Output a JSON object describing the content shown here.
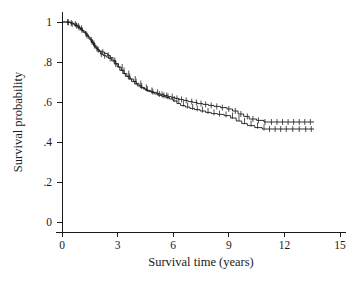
{
  "chart_data": {
    "type": "line",
    "title": "",
    "subtitle": "",
    "xlabel": "Survival time (years)",
    "ylabel": "Survival probability",
    "xlim": [
      0,
      15
    ],
    "ylim": [
      0,
      1
    ],
    "xticks": [
      0,
      3,
      6,
      9,
      12,
      15
    ],
    "xtick_labels": [
      "0",
      "3",
      "6",
      "9",
      "12",
      "15"
    ],
    "yticks": [
      0,
      0.2,
      0.4,
      0.6,
      0.8,
      1
    ],
    "ytick_labels": [
      "0",
      ".2",
      ".4",
      ".6",
      ".8",
      "1"
    ],
    "grid": false,
    "legend": false,
    "legend_position": "none",
    "annotations": [],
    "step_style": "post",
    "censoring_marks": true,
    "series": [
      {
        "name": "Group 1",
        "color": "#1a1a1a",
        "x": [
          0,
          0.25,
          0.45,
          0.62,
          0.8,
          0.95,
          1.1,
          1.25,
          1.4,
          1.52,
          1.65,
          1.78,
          1.9,
          2.02,
          2.15,
          2.3,
          2.45,
          2.6,
          2.75,
          2.9,
          3.05,
          3.2,
          3.35,
          3.5,
          3.68,
          3.85,
          4.0,
          4.15,
          4.3,
          4.45,
          4.6,
          4.78,
          4.95,
          5.1,
          5.3,
          5.5,
          5.7,
          5.9,
          6.1,
          6.3,
          6.55,
          6.8,
          7.05,
          7.3,
          7.6,
          7.9,
          8.2,
          8.55,
          8.9,
          9.2,
          9.5,
          9.8,
          10.1,
          10.5,
          10.9,
          13.6
        ],
        "y": [
          1.0,
          1.0,
          0.995,
          0.99,
          0.98,
          0.968,
          0.955,
          0.94,
          0.925,
          0.91,
          0.893,
          0.875,
          0.862,
          0.855,
          0.85,
          0.843,
          0.833,
          0.822,
          0.808,
          0.792,
          0.775,
          0.758,
          0.742,
          0.728,
          0.715,
          0.703,
          0.693,
          0.683,
          0.673,
          0.665,
          0.658,
          0.652,
          0.648,
          0.643,
          0.638,
          0.632,
          0.627,
          0.622,
          0.618,
          0.613,
          0.608,
          0.602,
          0.598,
          0.592,
          0.588,
          0.583,
          0.578,
          0.572,
          0.565,
          0.555,
          0.54,
          0.528,
          0.515,
          0.508,
          0.5,
          0.5
        ],
        "censored_x": [
          0.3,
          0.5,
          0.72,
          0.88,
          1.05,
          1.3,
          1.58,
          1.72,
          1.95,
          2.2,
          2.5,
          2.85,
          3.25,
          3.6,
          3.95,
          4.25,
          4.55,
          4.85,
          5.15,
          5.4,
          5.65,
          5.95,
          6.2,
          6.45,
          6.7,
          7.0,
          7.25,
          7.5,
          7.75,
          8.05,
          8.35,
          8.65,
          9.0,
          9.35,
          9.65,
          10.0,
          10.3,
          10.6,
          10.95,
          11.3,
          11.6,
          11.9,
          12.2,
          12.5,
          12.8,
          13.1,
          13.4
        ],
        "censored_y": [
          1.0,
          0.995,
          0.99,
          0.98,
          0.968,
          0.94,
          0.91,
          0.893,
          0.862,
          0.85,
          0.833,
          0.808,
          0.775,
          0.742,
          0.715,
          0.693,
          0.673,
          0.658,
          0.648,
          0.638,
          0.632,
          0.627,
          0.618,
          0.613,
          0.608,
          0.602,
          0.598,
          0.592,
          0.588,
          0.583,
          0.578,
          0.572,
          0.565,
          0.555,
          0.54,
          0.528,
          0.515,
          0.508,
          0.5,
          0.5,
          0.5,
          0.5,
          0.5,
          0.5,
          0.5,
          0.5,
          0.5
        ]
      },
      {
        "name": "Group 2",
        "color": "#1a1a1a",
        "x": [
          0,
          0.28,
          0.5,
          0.68,
          0.85,
          1.0,
          1.15,
          1.3,
          1.45,
          1.58,
          1.7,
          1.82,
          1.95,
          2.08,
          2.22,
          2.38,
          2.52,
          2.68,
          2.82,
          2.98,
          3.12,
          3.28,
          3.42,
          3.58,
          3.75,
          3.92,
          4.08,
          4.22,
          4.38,
          4.52,
          4.68,
          4.85,
          5.0,
          5.2,
          5.4,
          5.6,
          5.8,
          6.0,
          6.2,
          6.4,
          6.65,
          6.9,
          7.15,
          7.45,
          7.75,
          8.05,
          8.4,
          8.75,
          9.1,
          9.4,
          9.7,
          10.0,
          10.4,
          10.8,
          13.6
        ],
        "y": [
          1.0,
          0.998,
          0.99,
          0.982,
          0.972,
          0.96,
          0.948,
          0.932,
          0.915,
          0.9,
          0.882,
          0.868,
          0.852,
          0.84,
          0.832,
          0.825,
          0.818,
          0.805,
          0.79,
          0.775,
          0.758,
          0.742,
          0.728,
          0.715,
          0.702,
          0.69,
          0.68,
          0.672,
          0.665,
          0.658,
          0.652,
          0.646,
          0.64,
          0.633,
          0.628,
          0.622,
          0.615,
          0.605,
          0.592,
          0.582,
          0.575,
          0.568,
          0.562,
          0.555,
          0.548,
          0.542,
          0.538,
          0.532,
          0.52,
          0.505,
          0.492,
          0.482,
          0.472,
          0.465,
          0.465
        ],
        "censored_x": [
          0.35,
          0.55,
          0.78,
          0.92,
          1.08,
          1.35,
          1.62,
          1.75,
          1.88,
          2.12,
          2.3,
          2.6,
          2.9,
          3.35,
          3.65,
          4.0,
          4.3,
          4.6,
          4.9,
          5.25,
          5.5,
          5.72,
          6.05,
          6.3,
          6.55,
          6.78,
          7.05,
          7.3,
          7.58,
          7.88,
          8.2,
          8.5,
          8.85,
          9.2,
          9.55,
          9.85,
          10.2,
          10.55,
          10.9,
          11.2,
          11.5,
          11.8,
          12.1,
          12.45,
          12.8,
          13.15,
          13.45
        ],
        "censored_y": [
          0.998,
          0.99,
          0.982,
          0.972,
          0.96,
          0.932,
          0.9,
          0.882,
          0.868,
          0.84,
          0.832,
          0.818,
          0.79,
          0.758,
          0.728,
          0.702,
          0.68,
          0.665,
          0.652,
          0.64,
          0.633,
          0.628,
          0.615,
          0.605,
          0.592,
          0.582,
          0.575,
          0.568,
          0.562,
          0.555,
          0.548,
          0.542,
          0.538,
          0.532,
          0.52,
          0.505,
          0.492,
          0.482,
          0.472,
          0.465,
          0.465,
          0.465,
          0.465,
          0.465,
          0.465,
          0.465,
          0.465
        ]
      }
    ]
  },
  "axes": {
    "x_title": "Survival time (years)",
    "y_title": "Survival probability"
  }
}
